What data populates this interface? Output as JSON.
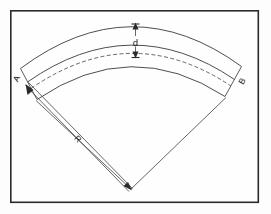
{
  "figure": {
    "kind": "technical-drawing",
    "background_color": "#fdfdfd",
    "frame": {
      "stroke_color": "#2b2b2b",
      "fill_color": "#fefefe",
      "x": 10,
      "y": 10,
      "width": 249,
      "height": 193
    },
    "apex": {
      "x": 131,
      "y": 189
    },
    "labels": {
      "thickness": "d",
      "radius": "R",
      "left_end": "A",
      "right_end": "B"
    },
    "arcs": [
      {
        "name": "outer-arc",
        "style": "solid",
        "radius": 176
      },
      {
        "name": "mid-upper-arc",
        "style": "solid",
        "radius": 152
      },
      {
        "name": "centerline-arc",
        "style": "dashed",
        "radius": 142
      },
      {
        "name": "inner-arc",
        "style": "solid",
        "radius": 126
      }
    ],
    "dimensions": [
      {
        "name": "thickness-dimension",
        "label": "d",
        "orientation": "vertical",
        "arrows": "both-ends"
      },
      {
        "name": "radius-dimension",
        "label": "R",
        "orientation": "diagonal",
        "arrows": "both-ends"
      }
    ]
  }
}
